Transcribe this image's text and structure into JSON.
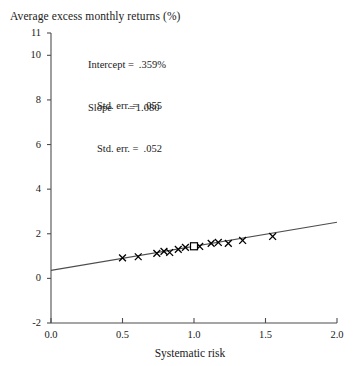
{
  "chart_data": {
    "type": "scatter",
    "title": "Average excess monthly returns (%)",
    "xlabel": "Systematic risk",
    "ylabel": "Average excess monthly returns (%)",
    "xlim": [
      0.0,
      2.0
    ],
    "ylim": [
      -2,
      11
    ],
    "xticks": [
      "0.0",
      "0.5",
      "1.0",
      "1.5",
      "2.0"
    ],
    "xtick_values": [
      0.0,
      0.5,
      1.0,
      1.5,
      2.0
    ],
    "yticks": [
      "-2",
      "0",
      "2",
      "4",
      "6",
      "8",
      "10",
      "11"
    ],
    "ytick_values": [
      -2,
      0,
      2,
      4,
      6,
      8,
      10,
      11
    ],
    "grid": false,
    "legend": "none",
    "series": [
      {
        "name": "Portfolios",
        "marker": "x",
        "color": "#000000",
        "points": [
          {
            "x": 0.5,
            "y": 0.92
          },
          {
            "x": 0.61,
            "y": 0.97
          },
          {
            "x": 0.74,
            "y": 1.12
          },
          {
            "x": 0.79,
            "y": 1.21
          },
          {
            "x": 0.83,
            "y": 1.16
          },
          {
            "x": 0.89,
            "y": 1.3
          },
          {
            "x": 0.94,
            "y": 1.39
          },
          {
            "x": 1.04,
            "y": 1.43
          },
          {
            "x": 1.12,
            "y": 1.57
          },
          {
            "x": 1.17,
            "y": 1.61
          },
          {
            "x": 1.24,
            "y": 1.57
          },
          {
            "x": 1.34,
            "y": 1.7
          },
          {
            "x": 1.55,
            "y": 1.88
          }
        ]
      },
      {
        "name": "Market portfolio",
        "marker": "open-square",
        "color": "#000000",
        "points": [
          {
            "x": 1.0,
            "y": 1.44
          }
        ]
      }
    ],
    "fit_line": {
      "name": "Fitted regression line",
      "intercept": 0.359,
      "slope": 1.08,
      "x_start": 0.0,
      "x_end": 2.0,
      "y_start": 0.359,
      "y_end": 2.519,
      "color": "#4d4d4d"
    },
    "annotations": {
      "intercept": {
        "label": "Intercept =",
        "value": ".359%",
        "stderr_label": "Std. err. =",
        "stderr_value": ".055"
      },
      "slope": {
        "label": "Slope",
        "equals": "=",
        "value": "1.080",
        "stderr_label": "Std. err. =",
        "stderr_value": ".052"
      }
    }
  }
}
